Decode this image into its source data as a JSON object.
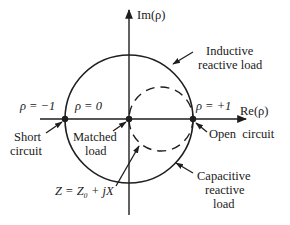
{
  "diagram": {
    "axes": {
      "imag_label": "Im(ρ)",
      "real_label": "Re(ρ)"
    },
    "points": {
      "short": {
        "rho_label": "ρ = −1",
        "name_line1": "Short",
        "name_line2": "circuit"
      },
      "matched": {
        "rho_label": "ρ = 0",
        "name_line1": "Matched",
        "name_line2": "load"
      },
      "open": {
        "rho_label": "ρ = +1",
        "name": "Open  circuit"
      }
    },
    "regions": {
      "inductive": {
        "line1": "Inductive",
        "line2": "reactive load"
      },
      "capacitive": {
        "line1": "Capacitive",
        "line2": "reactive",
        "line3": "load"
      }
    },
    "dashed_circle_label": "Z = Z₀ + jX",
    "colors": {
      "ink": "#1e1e1e",
      "background": "#ffffff"
    }
  }
}
